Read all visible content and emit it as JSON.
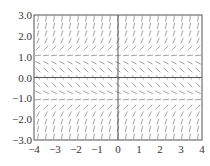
{
  "chart_data": {
    "type": "slope_field",
    "title": "",
    "xlabel": "",
    "ylabel": "",
    "equation": "dy/dx = y^2 - 1",
    "xlim": [
      -4,
      4
    ],
    "ylim": [
      -3,
      3
    ],
    "x_ticks": [
      -4,
      -3,
      -2,
      -1,
      0,
      1,
      2,
      3,
      4
    ],
    "x_tick_labels": [
      "−4",
      "−3",
      "−2",
      "−1",
      "0",
      "1",
      "2",
      "3",
      "4"
    ],
    "y_ticks": [
      3,
      2,
      1,
      0,
      -1,
      -2,
      -3
    ],
    "y_tick_labels": [
      "3.0",
      "2.0",
      "1.0",
      "0.0",
      "−1.0",
      "−2.0",
      "−3.0"
    ],
    "grid_columns": 21,
    "grid_rows": 17,
    "zero_axes": true,
    "grid": false,
    "legend": null,
    "colors": {
      "segment": "#8a8a8a",
      "axis": "#555555",
      "frame": "#555555"
    }
  }
}
